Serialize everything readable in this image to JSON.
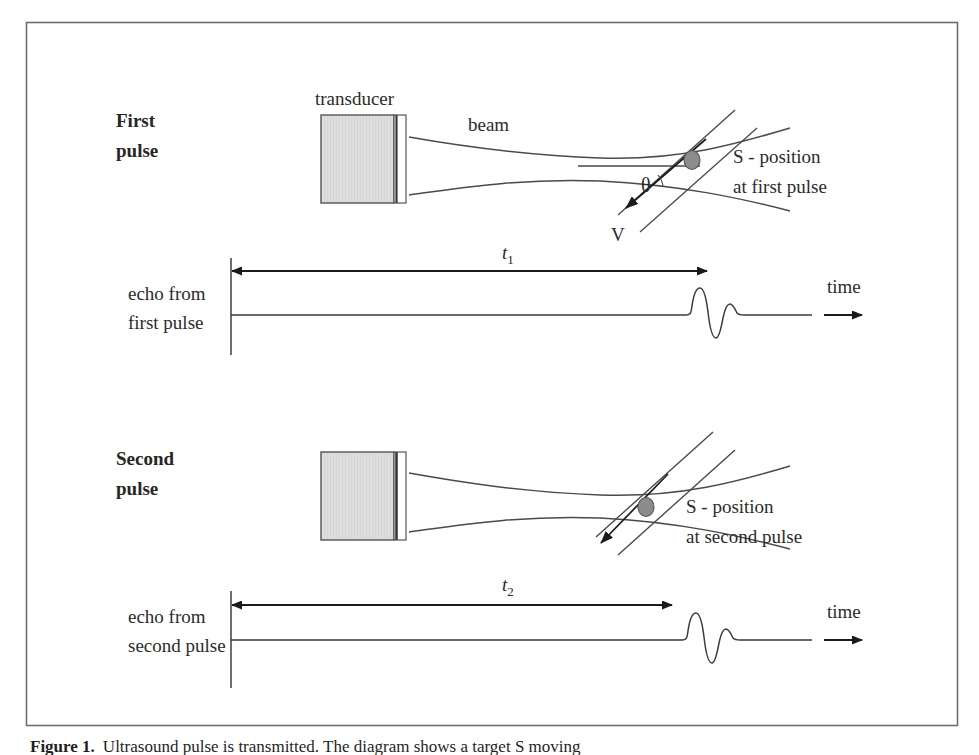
{
  "figure": {
    "border_color": "#6e6e6e",
    "background": "#ffffff",
    "line_color": "#4a4a4a",
    "ink_color": "#2b2b2b",
    "transducer_fill": "#dcdcdc",
    "transducer_stroke": "#555555",
    "scatterer_fill": "#8c8c8c",
    "scatterer_stroke": "#555555"
  },
  "panels": {
    "first": {
      "section_label_line1": "First",
      "section_label_line2": "pulse",
      "transducer_label": "transducer",
      "beam_label": "beam",
      "angle_label": "θ",
      "velocity_label": "V",
      "scatterer_label_line1": "S - position",
      "scatterer_label_line2": "at first pulse",
      "echo_label_line1": "echo from",
      "echo_label_line2": "first pulse",
      "time_label": "time",
      "interval_label": "t",
      "interval_subscript": "1"
    },
    "second": {
      "section_label_line1": "Second",
      "section_label_line2": "pulse",
      "scatterer_label_line1": "S - position",
      "scatterer_label_line2": "at second pulse",
      "echo_label_line1": "echo from",
      "echo_label_line2": "second pulse",
      "time_label": "time",
      "interval_label": "t",
      "interval_subscript": "2"
    }
  },
  "caption": {
    "figure_number": "Figure 1.",
    "text": "Ultrasound pulse is transmitted. The diagram shows a target S moving"
  }
}
